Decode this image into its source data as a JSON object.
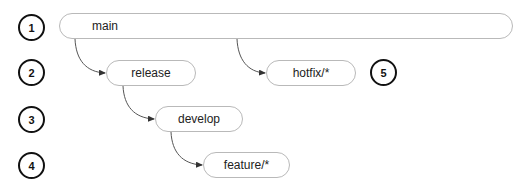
{
  "diagram": {
    "type": "git-branching-flow",
    "branches": [
      {
        "id": "main",
        "label": "main"
      },
      {
        "id": "release",
        "label": "release"
      },
      {
        "id": "hotfix",
        "label": "hotfix/*"
      },
      {
        "id": "develop",
        "label": "develop"
      },
      {
        "id": "feature",
        "label": "feature/*"
      }
    ],
    "steps": [
      {
        "id": "step-1",
        "label": "1"
      },
      {
        "id": "step-2",
        "label": "2"
      },
      {
        "id": "step-3",
        "label": "3"
      },
      {
        "id": "step-4",
        "label": "4"
      },
      {
        "id": "step-5",
        "label": "5"
      }
    ],
    "edges": [
      {
        "from": "main",
        "to": "release"
      },
      {
        "from": "main",
        "to": "hotfix"
      },
      {
        "from": "release",
        "to": "develop"
      },
      {
        "from": "develop",
        "to": "feature"
      }
    ],
    "colors": {
      "node_border": "#b9b9b9",
      "edge": "#444444",
      "step_border": "#111111",
      "text": "#222222"
    }
  }
}
